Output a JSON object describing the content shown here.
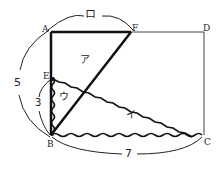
{
  "diagram": {
    "points": {
      "A": {
        "label": "A",
        "x": 51,
        "y": 32
      },
      "F": {
        "label": "F",
        "x": 131,
        "y": 32
      },
      "D": {
        "label": "D",
        "x": 204,
        "y": 32
      },
      "E": {
        "label": "E",
        "x": 51,
        "y": 78
      },
      "B": {
        "label": "B",
        "x": 51,
        "y": 135
      },
      "C": {
        "label": "C",
        "x": 202,
        "y": 135
      }
    },
    "regions": {
      "a": "ア",
      "i": "イ",
      "u": "ウ"
    },
    "dimensions": {
      "AF": "ロ",
      "AB": "5",
      "EB": "3",
      "BC": "7"
    },
    "colors": {
      "line": "#111111",
      "thin_line": "#333333",
      "background": "#ffffff"
    }
  }
}
